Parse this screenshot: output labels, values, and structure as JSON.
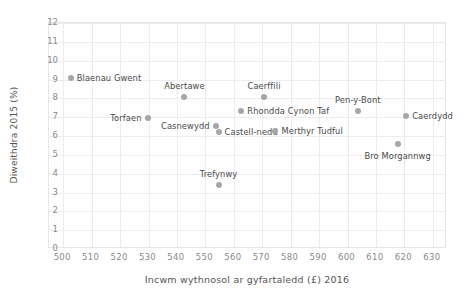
{
  "chart_data": {
    "type": "scatter",
    "title": "",
    "xlabel": "Incwm wythnosol ar gyfartaledd (£) 2016",
    "ylabel": "Diweithdra 2015 (%)",
    "xlim": [
      495,
      635
    ],
    "ylim": [
      0,
      12
    ],
    "grid": true,
    "legend": "none",
    "xticks": [
      "500",
      "510",
      "520",
      "530",
      "540",
      "550",
      "560",
      "570",
      "580",
      "590",
      "600",
      "610",
      "620",
      "630"
    ],
    "xtick_values": [
      500,
      510,
      520,
      530,
      540,
      550,
      560,
      570,
      580,
      590,
      600,
      610,
      620,
      630
    ],
    "yticks": [
      "0",
      "1",
      "2",
      "3",
      "4",
      "5",
      "6",
      "7",
      "8",
      "9",
      "10",
      "11",
      "12"
    ],
    "ytick_values": [
      0,
      1,
      2,
      3,
      4,
      5,
      6,
      7,
      8,
      9,
      10,
      11,
      12
    ],
    "marker_color": "#a6a6a6",
    "points": [
      {
        "label": "Blaenau Gwent",
        "x": 503,
        "y": 9.05,
        "label_pos": "right"
      },
      {
        "label": "Torfaen",
        "x": 530,
        "y": 6.9,
        "label_pos": "left"
      },
      {
        "label": "Abertawe",
        "x": 543,
        "y": 8.0,
        "label_pos": "above"
      },
      {
        "label": "Casnewydd",
        "x": 554,
        "y": 6.5,
        "label_pos": "left"
      },
      {
        "label": "Trefynwy",
        "x": 555,
        "y": 3.35,
        "label_pos": "above"
      },
      {
        "label": "Castell-nedd",
        "x": 555,
        "y": 6.15,
        "label_pos": "right"
      },
      {
        "label": "Rhondda Cynon Taf",
        "x": 563,
        "y": 7.3,
        "label_pos": "right"
      },
      {
        "label": "Caerffili",
        "x": 571,
        "y": 8.0,
        "label_pos": "above"
      },
      {
        "label": "Merthyr Tudful",
        "x": 575,
        "y": 6.2,
        "label_pos": "right"
      },
      {
        "label": "Pen-y-Bont",
        "x": 604,
        "y": 7.3,
        "label_pos": "above"
      },
      {
        "label": "Bro Morgannwg",
        "x": 618,
        "y": 5.5,
        "label_pos": "below"
      },
      {
        "label": "Caerdydd",
        "x": 621,
        "y": 7.0,
        "label_pos": "right"
      }
    ]
  }
}
